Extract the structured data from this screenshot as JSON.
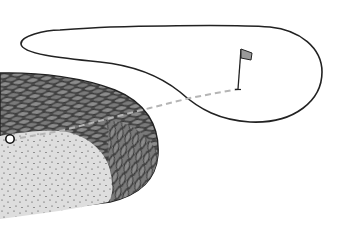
{
  "illustration": {
    "subject": "golf hole diagram",
    "elements": {
      "green": {
        "shape": "outlined fairway/green loop"
      },
      "flag": {
        "icon": "flag-icon",
        "color": "#9a9a9a"
      },
      "ball": {
        "icon": "golf-ball-icon",
        "color": "#ffffff"
      },
      "rough": {
        "pattern": "scale-hatch",
        "color": "#6e6e6e"
      },
      "bunker": {
        "pattern": "stipple",
        "color": "#dcdcdc"
      },
      "shot_line": {
        "style": "dashed",
        "color": "#b8b8b8"
      }
    },
    "colors": {
      "outline": "#222222",
      "background": "#ffffff"
    }
  }
}
